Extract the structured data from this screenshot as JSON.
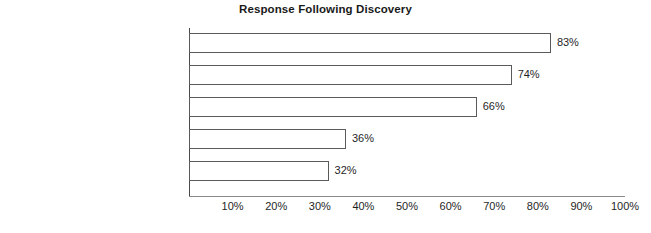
{
  "chart_data": {
    "type": "bar",
    "orientation": "horizontal",
    "title": "Response Following Discovery",
    "xlabel": "",
    "ylabel": "",
    "categories": [
      "Investigation",
      "Immediate Dismissal",
      "Reported to Police",
      "Civil Action for Recovery",
      "Reviewed by Audit Committee"
    ],
    "values": [
      83,
      74,
      66,
      36,
      32
    ],
    "value_labels": [
      "83%",
      "74%",
      "66%",
      "36%",
      "32%"
    ],
    "xlim": [
      0,
      100
    ],
    "xticks": [
      10,
      20,
      30,
      40,
      50,
      60,
      70,
      80,
      90,
      100
    ],
    "xtick_labels": [
      "10%",
      "20%",
      "30%",
      "40%",
      "50%",
      "60%",
      "70%",
      "80%",
      "90%",
      "100%"
    ],
    "grid": false,
    "legend": null,
    "colors": {
      "bar_fill": "#ffffff",
      "bar_outline": "#5a5a5a",
      "axis": "#4a4a4a",
      "text": "#1f1f1f",
      "background": "#ffffff"
    }
  }
}
